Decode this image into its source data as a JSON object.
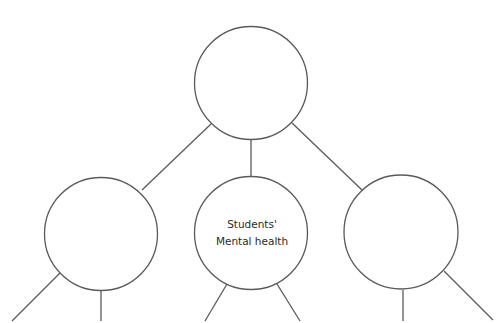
{
  "diagram": {
    "type": "mind-map",
    "colors": {
      "stroke": "#5a5a5a",
      "text": "#2a2a2a",
      "background": "#ffffff"
    },
    "nodes": [
      {
        "id": "top",
        "label_lines": [
          "",
          ""
        ]
      },
      {
        "id": "left",
        "label_lines": [
          "",
          ""
        ]
      },
      {
        "id": "center",
        "label_lines": [
          "Students'",
          "Mental health"
        ]
      },
      {
        "id": "right",
        "label_lines": [
          "",
          ""
        ]
      }
    ],
    "edges": [
      {
        "from": "top",
        "to": "left"
      },
      {
        "from": "top",
        "to": "center"
      },
      {
        "from": "top",
        "to": "right"
      },
      {
        "from": "left",
        "to": "offscreen-left-1"
      },
      {
        "from": "left",
        "to": "offscreen-left-2"
      },
      {
        "from": "center",
        "to": "offscreen-center-1"
      },
      {
        "from": "center",
        "to": "offscreen-center-2"
      },
      {
        "from": "right",
        "to": "offscreen-right-1"
      },
      {
        "from": "right",
        "to": "offscreen-right-2"
      }
    ]
  }
}
